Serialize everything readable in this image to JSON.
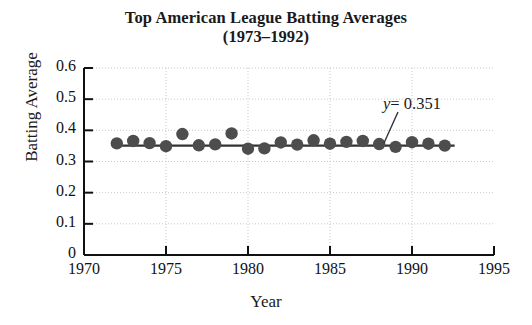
{
  "chart_data": {
    "type": "scatter",
    "title": "Top American League Batting Averages (1973–1992)",
    "title_line1": "Top American League Batting Averages",
    "title_line2": "(1973–1992)",
    "xlabel": "Year",
    "ylabel": "Batting Average",
    "xlim": [
      1970,
      1995
    ],
    "ylim": [
      0,
      0.6
    ],
    "xticks": [
      1970,
      1975,
      1980,
      1985,
      1990,
      1995
    ],
    "xtick_labels": [
      "1970",
      "1975",
      "1980",
      "1985",
      "1990",
      "1995"
    ],
    "yticks": [
      0,
      0.1,
      0.2,
      0.3,
      0.4,
      0.5,
      0.6
    ],
    "ytick_labels": [
      "0",
      "0.1",
      "0.2",
      "0.3",
      "0.4",
      "0.5",
      "0.6"
    ],
    "grid": true,
    "grid_style": "dotted",
    "legend": null,
    "marker_color": "#4d4d4d",
    "line_color": "#333333",
    "axis_color": "#111111",
    "grid_color": "#c8c8c8",
    "x": [
      1972,
      1973,
      1974,
      1975,
      1976,
      1977,
      1978,
      1979,
      1980,
      1981,
      1982,
      1983,
      1984,
      1985,
      1986,
      1987,
      1988,
      1989,
      1990,
      1991,
      1992
    ],
    "y": [
      0.358,
      0.366,
      0.359,
      0.349,
      0.388,
      0.352,
      0.355,
      0.39,
      0.341,
      0.342,
      0.361,
      0.354,
      0.368,
      0.357,
      0.363,
      0.366,
      0.356,
      0.347,
      0.362,
      0.357,
      0.351
    ],
    "values": [
      0.358,
      0.366,
      0.359,
      0.349,
      0.388,
      0.352,
      0.355,
      0.39,
      0.341,
      0.342,
      0.361,
      0.354,
      0.368,
      0.357,
      0.363,
      0.366,
      0.356,
      0.347,
      0.362,
      0.357,
      0.351
    ],
    "categories": [
      "1972",
      "1973",
      "1974",
      "1975",
      "1976",
      "1977",
      "1978",
      "1979",
      "1980",
      "1981",
      "1982",
      "1983",
      "1984",
      "1985",
      "1986",
      "1987",
      "1988",
      "1989",
      "1990",
      "1991",
      "1992"
    ],
    "fit_line": {
      "equation_label": "y = 0.351",
      "equation_variable": "y",
      "equation_rest": " = 0.351",
      "value": 0.351,
      "x_start": 1972,
      "x_end": 1992.6,
      "slope": 0
    },
    "annotation": {
      "text": "y = 0.351",
      "variable": "y",
      "rest": "= 0.351"
    }
  }
}
